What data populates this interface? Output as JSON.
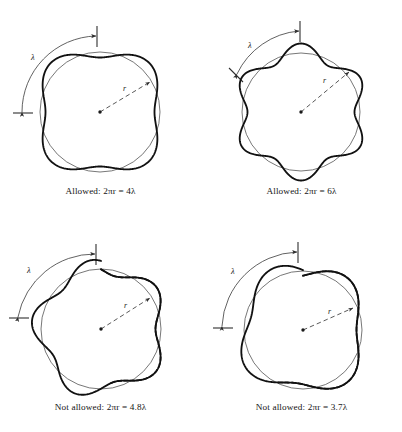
{
  "figure": {
    "background_color": "#ffffff",
    "ink_color": "#141414",
    "thin_line_color": "#3a3a3a",
    "thick_line_color": "#111111",
    "width": 402,
    "height": 432
  },
  "labels": {
    "lambda": "λ",
    "radius": "r",
    "allowed": "Allowed:",
    "not_allowed": "Not allowed:",
    "two_pi_r": "2πr",
    "equals": "="
  },
  "panels": [
    {
      "id": "top-left",
      "verdict": "Allowed:",
      "expression": "2πr = 4λ",
      "coefficient": "4",
      "caption": "Allowed:  2πr = 4λ",
      "wave_count": 4,
      "closes": true,
      "has_dashed_mismatch": false,
      "lambda_arc_label": "λ",
      "radius_label": "r"
    },
    {
      "id": "top-right",
      "verdict": "Allowed:",
      "expression": "2πr = 6λ",
      "coefficient": "6",
      "caption": "Allowed:  2πr = 6λ",
      "wave_count": 6,
      "closes": true,
      "has_dashed_mismatch": false,
      "lambda_arc_label": "λ",
      "radius_label": "r"
    },
    {
      "id": "bottom-left",
      "verdict": "Not allowed:",
      "expression": "2πr = 4.8λ",
      "coefficient": "4.8",
      "caption": "Not allowed:  2πr = 4.8λ",
      "wave_count": 4.8,
      "closes": false,
      "has_dashed_mismatch": true,
      "lambda_arc_label": "λ",
      "radius_label": "r"
    },
    {
      "id": "bottom-right",
      "verdict": "Not allowed:",
      "expression": "2πr = 3.7λ",
      "coefficient": "3.7",
      "caption": "Not allowed:  2πr = 3.7λ",
      "wave_count": 3.7,
      "closes": false,
      "has_dashed_mismatch": true,
      "lambda_arc_label": "λ",
      "radius_label": "r"
    }
  ],
  "chart_data": {
    "type": "line",
    "xlabel": "",
    "ylabel": "",
    "coordinate_system": "polar",
    "radial_equation": "R(θ) = r + a·sin(nθ + φ)",
    "base_radius": 62,
    "amplitude": 7.5,
    "series": [
      {
        "name": "Allowed: 2πr = 4λ",
        "n_wavelengths": 4,
        "closes": true,
        "panel": "top-left"
      },
      {
        "name": "Allowed: 2πr = 6λ",
        "n_wavelengths": 6,
        "closes": true,
        "panel": "top-right"
      },
      {
        "name": "Not allowed: 2πr = 4.8λ",
        "n_wavelengths": 4.8,
        "closes": false,
        "panel": "bottom-left"
      },
      {
        "name": "Not allowed: 2πr = 3.7λ",
        "n_wavelengths": 3.7,
        "closes": false,
        "panel": "bottom-right"
      }
    ],
    "legend_position": "none",
    "grid": false
  }
}
